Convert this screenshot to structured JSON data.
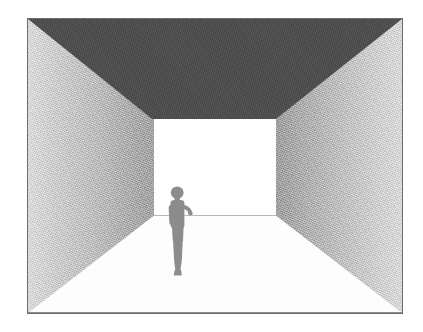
{
  "scene": {
    "title": "One-point perspective room interior",
    "description": "A grayscale illustration of an empty rectangular room drawn in one-point perspective. A dark ceiling forms a trapezoid at the top, two shaded side walls converge toward a bright rectangular back wall, and a small gray human silhouette stands on the white floor to the left of center.",
    "frame": {
      "x": 27,
      "y": 18,
      "width": 376,
      "height": 296,
      "border_color": "#6d6d6d"
    },
    "surfaces": [
      {
        "id": "ceiling",
        "label": "Ceiling",
        "shape": "trapezoid",
        "color": "#4a4a4a",
        "shading": "flat dark gray with fine grain"
      },
      {
        "id": "wall-left",
        "label": "Left wall",
        "shape": "trapezoid",
        "color_front": "#e2e2e2",
        "color_back": "#9d9d9d",
        "shading": "gradient light at front edge to darker at back corner"
      },
      {
        "id": "wall-right",
        "label": "Right wall",
        "shape": "trapezoid",
        "color_front": "#e0e0e0",
        "color_back": "#989898",
        "shading": "gradient darker at back corner to light at front edge"
      },
      {
        "id": "back-wall",
        "label": "Back wall",
        "shape": "rectangle",
        "color": "#fefefe",
        "shading": "bright, nearly white"
      },
      {
        "id": "floor",
        "label": "Floor",
        "shape": "trapezoid",
        "color": "#fdfdfd",
        "shading": "white, unshaded"
      }
    ],
    "figure": {
      "label": "Standing person silhouette",
      "color": "#8c8c8c",
      "pose": "standing in profile facing right, one arm raised forward",
      "position": "left of center, standing on the floor near the back wall"
    },
    "palette": {
      "ceiling": "#4a4a4a",
      "wall_light": "#e2e2e2",
      "wall_dark": "#989898",
      "floor": "#fdfdfd",
      "back_wall": "#fefefe",
      "figure": "#8c8c8c",
      "frame_border": "#6d6d6d",
      "page_background": "#ffffff"
    }
  }
}
